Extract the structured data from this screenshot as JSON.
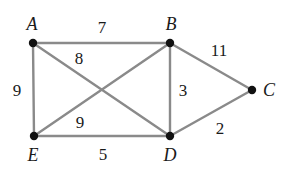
{
  "figure": {
    "type": "weighted-undirected-graph",
    "width": 289,
    "height": 171,
    "background_color": "#ffffff",
    "edge_color": "#8a8a8a",
    "vertex_color": "#111111",
    "label_color": "#1a1a1a"
  },
  "vertices": [
    {
      "id": "A",
      "label": "A",
      "x": 33,
      "y": 43,
      "label_x": 32,
      "label_y": 24
    },
    {
      "id": "B",
      "label": "B",
      "x": 170,
      "y": 43,
      "label_x": 171,
      "label_y": 24
    },
    {
      "id": "C",
      "label": "C",
      "x": 252,
      "y": 90,
      "label_x": 269,
      "label_y": 90
    },
    {
      "id": "D",
      "label": "D",
      "x": 170,
      "y": 136,
      "label_x": 170,
      "label_y": 155
    },
    {
      "id": "E",
      "label": "E",
      "x": 34,
      "y": 136,
      "label_x": 33,
      "label_y": 155
    }
  ],
  "edges": [
    {
      "from": "A",
      "to": "B",
      "weight": "7",
      "label_x": 102,
      "label_y": 27
    },
    {
      "from": "A",
      "to": "E",
      "weight": "9",
      "label_x": 17,
      "label_y": 90
    },
    {
      "from": "A",
      "to": "D",
      "weight": "8",
      "label_x": 79,
      "label_y": 58
    },
    {
      "from": "E",
      "to": "B",
      "weight": "9",
      "label_x": 80,
      "label_y": 122
    },
    {
      "from": "E",
      "to": "D",
      "weight": "5",
      "label_x": 103,
      "label_y": 154
    },
    {
      "from": "B",
      "to": "D",
      "weight": "3",
      "label_x": 183,
      "label_y": 90
    },
    {
      "from": "B",
      "to": "C",
      "weight": "11",
      "label_x": 219,
      "label_y": 50
    },
    {
      "from": "D",
      "to": "C",
      "weight": "2",
      "label_x": 220,
      "label_y": 128
    }
  ]
}
